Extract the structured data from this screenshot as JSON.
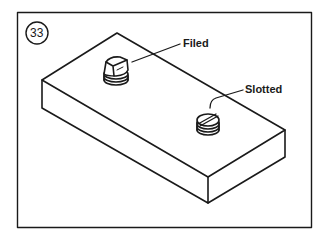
{
  "figure": {
    "number": "33",
    "labels": {
      "filed": "Filed",
      "slotted": "Slotted"
    },
    "colors": {
      "line": "#1a1a1a",
      "background": "#ffffff"
    }
  }
}
